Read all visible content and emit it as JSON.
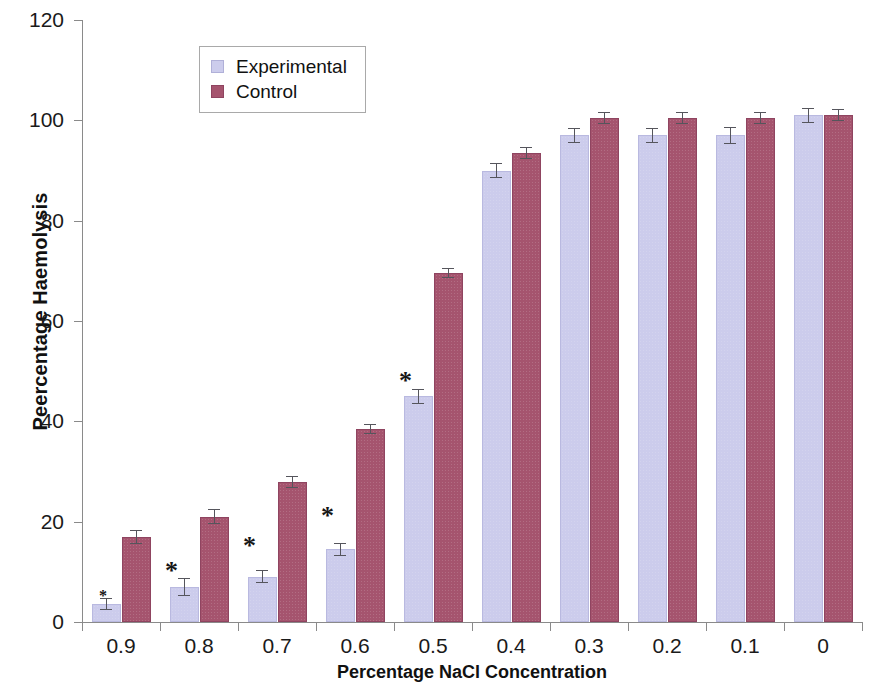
{
  "chart_data": {
    "type": "bar",
    "title": "",
    "xlabel": "Percentage NaCl Concentration",
    "ylabel": "Peercentage Haemolysis",
    "categories": [
      "0.9",
      "0.8",
      "0.7",
      "0.6",
      "0.5",
      "0.4",
      "0.3",
      "0.2",
      "0.1",
      "0"
    ],
    "series": [
      {
        "name": "Experimental",
        "color": "#ccccec",
        "values": [
          3.5,
          7,
          9,
          14.5,
          45,
          90,
          97,
          97,
          97,
          101
        ],
        "errors": [
          1.2,
          1.8,
          1.3,
          1.3,
          1.5,
          1.5,
          1.5,
          1.5,
          1.7,
          1.5
        ]
      },
      {
        "name": "Control",
        "color": "#a5546e",
        "values": [
          17,
          21,
          28,
          38.5,
          69.5,
          93.5,
          100.5,
          100.5,
          100.5,
          101
        ],
        "errors": [
          1.4,
          1.5,
          1.2,
          1.0,
          1.0,
          1.2,
          1.2,
          1.2,
          1.2,
          1.2
        ]
      }
    ],
    "ylim": [
      0,
      120
    ],
    "ytick_values": [
      0,
      20,
      40,
      60,
      80,
      100,
      120
    ],
    "ytick_labels": [
      "0",
      "20",
      "40",
      "60",
      "80",
      "100",
      "120"
    ],
    "grid": false,
    "legend_position": "top-left-inset",
    "annotations": [
      {
        "label": "*",
        "group_index": 0,
        "x_offset": -22,
        "y_value": 3.5,
        "size": "small"
      },
      {
        "label": "*",
        "group_index": 0,
        "x_offset": 44,
        "y_value": 7.5,
        "size": "large"
      },
      {
        "label": "*",
        "group_index": 1,
        "x_offset": 44,
        "y_value": 12.5,
        "size": "large"
      },
      {
        "label": "*",
        "group_index": 2,
        "x_offset": 44,
        "y_value": 18.5,
        "size": "large"
      },
      {
        "label": "*",
        "group_index": 3,
        "x_offset": 44,
        "y_value": 45.5,
        "size": "large"
      }
    ]
  },
  "legend": {
    "items": [
      {
        "label": "Experimental",
        "swatch": "experimental"
      },
      {
        "label": "Control",
        "swatch": "control"
      }
    ]
  },
  "axis": {
    "x_title": "Percentage NaCl Concentration",
    "y_title": "Peercentage Haemolysis"
  }
}
